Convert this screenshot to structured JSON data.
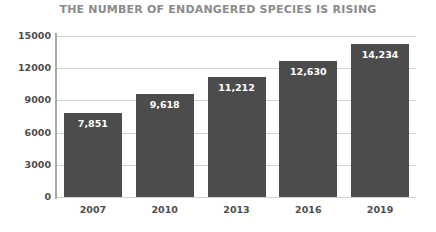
{
  "chart_data": {
    "type": "bar",
    "title": "THE NUMBER OF ENDANGERED SPECIES IS RISING",
    "xlabel": "",
    "ylabel": "",
    "categories": [
      "2007",
      "2010",
      "2013",
      "2016",
      "2019"
    ],
    "values": [
      7851,
      9618,
      11212,
      12630,
      14234
    ],
    "value_labels": [
      "7,851",
      "9,618",
      "11,212",
      "12,630",
      "14,234"
    ],
    "ylim": [
      0,
      15000
    ],
    "ytick_labels": [
      "15000",
      "12000",
      "9000",
      "6000",
      "3000",
      "0"
    ],
    "ytick_values": [
      15000,
      12000,
      9000,
      6000,
      3000,
      0
    ],
    "grid": true,
    "legend": false,
    "colors": {
      "bar": "#4c4c4c",
      "title": "#8b8b8b",
      "tick_text": "#4d4d4d",
      "gridline": "#d2d2d2",
      "axis": "#a8a8a8",
      "value_label": "#ffffff",
      "background": "#ffffff"
    }
  }
}
